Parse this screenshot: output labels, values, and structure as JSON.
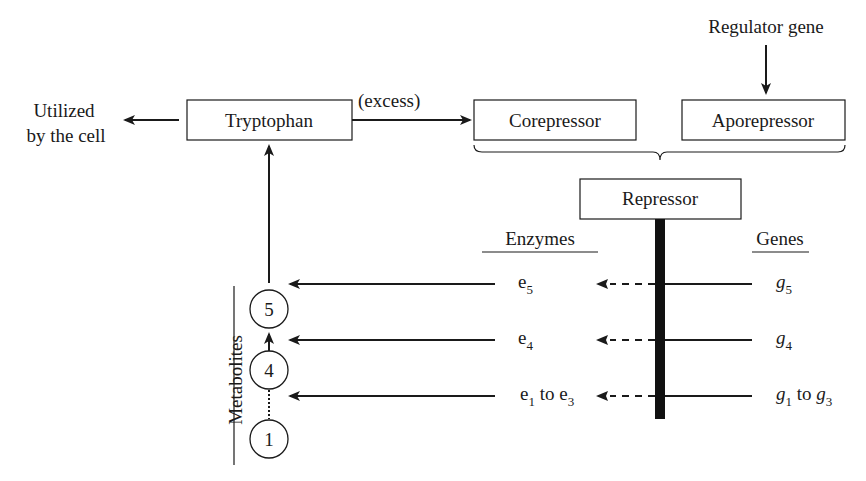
{
  "diagram": {
    "utilized_label": [
      "Utilized",
      "by the cell"
    ],
    "tryptophan": "Tryptophan",
    "excess_label": "(excess)",
    "corepressor": "Corepressor",
    "aporepressor": "Aporepressor",
    "regulator_gene": "Regulator gene",
    "repressor": "Repressor",
    "enzymes_heading": "Enzymes",
    "genes_heading": "Genes",
    "metabolites_label": "Metabolites",
    "metabolites": [
      "5",
      "4",
      "1"
    ],
    "rows": [
      {
        "enzyme": "e",
        "enzyme_sub": "5",
        "enzyme_mid": "",
        "enzyme2": "",
        "enzyme2_sub": "",
        "gene": "g",
        "gene_sub": "5",
        "gene_mid": "",
        "gene2": "",
        "gene2_sub": ""
      },
      {
        "enzyme": "e",
        "enzyme_sub": "4",
        "enzyme_mid": "",
        "enzyme2": "",
        "enzyme2_sub": "",
        "gene": "g",
        "gene_sub": "4",
        "gene_mid": "",
        "gene2": "",
        "gene2_sub": ""
      },
      {
        "enzyme": "e",
        "enzyme_sub": "1",
        "enzyme_mid": " to ",
        "enzyme2": "e",
        "enzyme2_sub": "3",
        "gene": "g",
        "gene_sub": "1",
        "gene_mid": " to ",
        "gene2": "g",
        "gene2_sub": "3"
      }
    ]
  }
}
